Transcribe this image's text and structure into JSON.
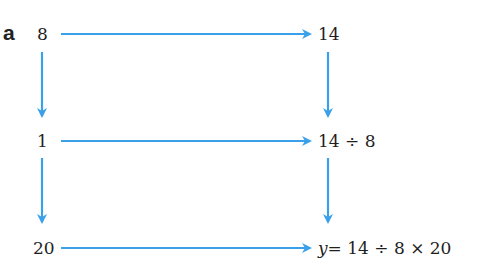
{
  "diagram": {
    "part_label": "a",
    "arrow_color": "#3aa0ea",
    "left_column": [
      "8",
      "1",
      "20"
    ],
    "right_column": [
      "14",
      "14 ÷ 8",
      "= 14 ÷ 8 × 20"
    ],
    "result_variable": "y"
  }
}
